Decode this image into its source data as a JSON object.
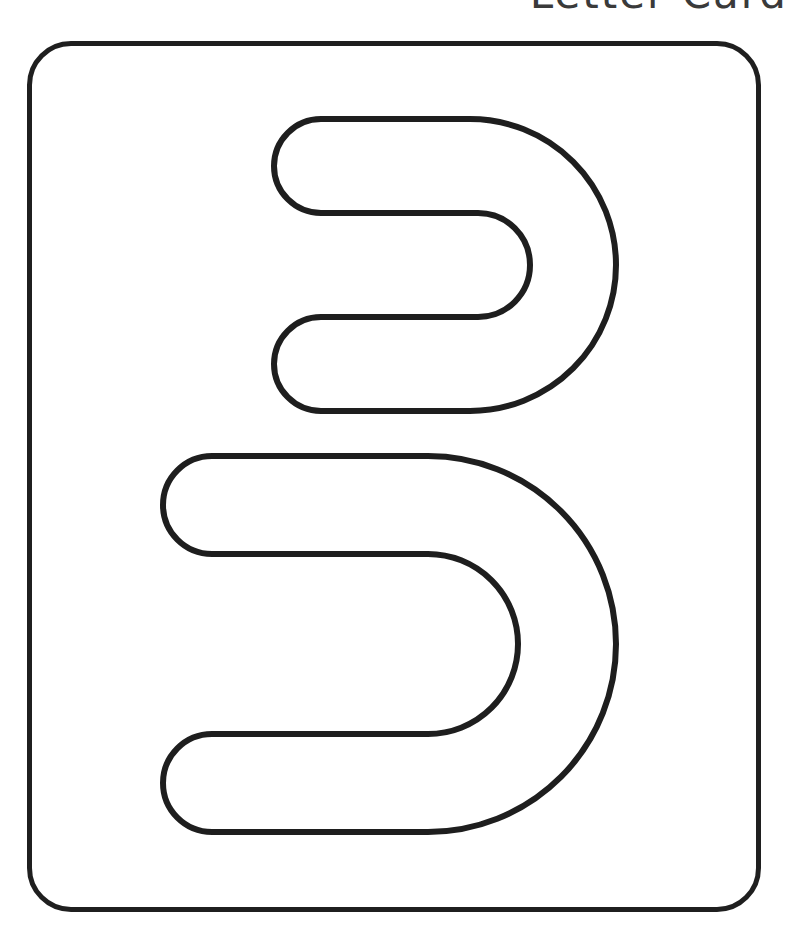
{
  "header": {
    "title": "Letter Card"
  },
  "card": {
    "letter": "3",
    "stroke_color": "#1e1e1e",
    "background_color": "#ffffff"
  }
}
